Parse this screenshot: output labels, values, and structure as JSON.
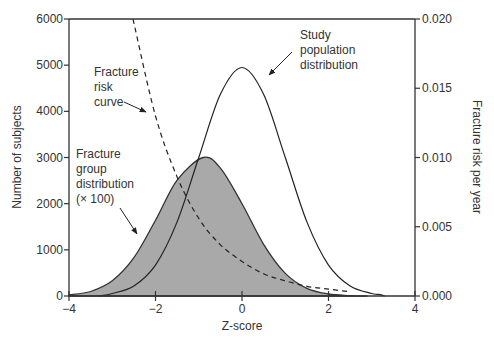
{
  "chart_data": {
    "type": "line",
    "title": "",
    "xlabel": "Z-score",
    "ylabel": "Number of subjects",
    "ylabel_right": "Fracture risk per year",
    "xlim": [
      -4,
      4
    ],
    "ylim": [
      0,
      6000
    ],
    "ylim_right": [
      0,
      0.02
    ],
    "x_ticks": [
      "−4",
      "−2",
      "0",
      "2",
      "4"
    ],
    "x_tick_values": [
      -4,
      -2,
      0,
      2,
      4
    ],
    "y_ticks": [
      "0",
      "1000",
      "2000",
      "3000",
      "4000",
      "5000",
      "6000"
    ],
    "y_tick_values": [
      0,
      1000,
      2000,
      3000,
      4000,
      5000,
      6000
    ],
    "y_right_ticks": [
      "0.000",
      "0.005",
      "0.010",
      "0.015",
      "0.020"
    ],
    "y_right_tick_values": [
      0,
      0.005,
      0.01,
      0.015,
      0.02
    ],
    "grid": false,
    "series": [
      {
        "name": "Study population distribution",
        "style": "solid-line",
        "axis": "left",
        "x": [
          -3,
          -2.5,
          -2,
          -1.5,
          -1,
          -0.5,
          0,
          0.5,
          1,
          1.5,
          2,
          2.5,
          3,
          3.2
        ],
        "values": [
          55,
          217,
          670,
          1605,
          3000,
          4368,
          4950,
          4368,
          3000,
          1605,
          670,
          217,
          55,
          30
        ]
      },
      {
        "name": "Fracture group distribution (× 100)",
        "style": "filled-gray",
        "axis": "left",
        "x": [
          -4,
          -3.5,
          -3,
          -2.5,
          -2,
          -1.5,
          -0.9,
          -0.5,
          0,
          0.5,
          1,
          1.5,
          2,
          2.5
        ],
        "values": [
          24,
          98,
          330,
          830,
          1640,
          2510,
          3000,
          2770,
          2000,
          1120,
          490,
          165,
          44,
          9
        ]
      },
      {
        "name": "Fracture risk curve",
        "style": "dashed-line",
        "axis": "right",
        "x": [
          -2.52,
          -2,
          -1.5,
          -1,
          -0.5,
          0,
          0.5,
          1,
          1.5,
          2,
          2.5
        ],
        "values": [
          0.02,
          0.013,
          0.0086,
          0.0056,
          0.0037,
          0.0025,
          0.0016,
          0.0011,
          0.0007,
          0.0005,
          0.0003
        ]
      }
    ],
    "annotations": [
      {
        "id": "population",
        "lines": [
          "Study",
          "population",
          "distribution"
        ]
      },
      {
        "id": "risk",
        "lines": [
          "Fracture",
          "risk",
          "curve"
        ]
      },
      {
        "id": "group",
        "lines": [
          "Fracture",
          "group",
          "distribution",
          "(× 100)"
        ]
      }
    ]
  },
  "colors": {
    "fill": "#a8a8a8",
    "line": "#222222",
    "axis": "#333333"
  }
}
